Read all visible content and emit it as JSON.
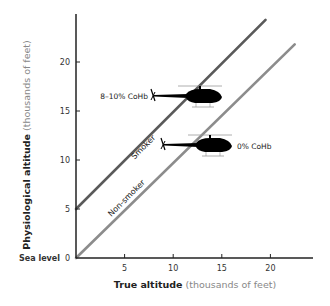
{
  "chart_data": {
    "type": "line",
    "title": "",
    "xlabel": {
      "bold": "True altitude",
      "light": " (thousands of feet)"
    },
    "ylabel": {
      "bold": "Physiological altitude",
      "light": " (thousands of feet)"
    },
    "xlim": [
      0,
      24
    ],
    "ylim": [
      0,
      24
    ],
    "xticks": [
      5,
      10,
      15,
      20
    ],
    "yticks": [
      {
        "value": 0,
        "label": "0"
      },
      {
        "value": 5,
        "label": "5"
      },
      {
        "value": 10,
        "label": "10"
      },
      {
        "value": 15,
        "label": "15"
      },
      {
        "value": 20,
        "label": "20"
      }
    ],
    "y_zero_extra_label": "Sea level",
    "grid": false,
    "series": [
      {
        "name": "Smoker",
        "color": "#5a5a5a",
        "x": [
          0,
          19.5
        ],
        "y": [
          5,
          24.3
        ],
        "annotation": "8–10% CoHb"
      },
      {
        "name": "Non-smoker",
        "color": "#8c8c8c",
        "x": [
          0,
          22.5
        ],
        "y": [
          0,
          21.8
        ],
        "annotation": "0% CoHb"
      }
    ]
  }
}
